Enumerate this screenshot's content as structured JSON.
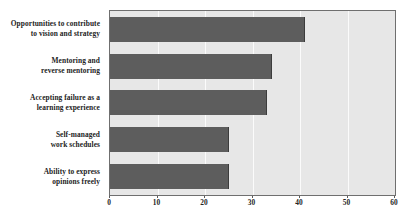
{
  "chart_data": {
    "type": "bar",
    "orientation": "horizontal",
    "title": "",
    "subtitle": "",
    "xlabel": "",
    "ylabel": "",
    "categories": [
      "Opportunities to contribute\nto vision and strategy",
      "Mentoring and\nreverse mentoring",
      "Accepting failure as a\nlearning experience",
      "Self-managed\nwork schedules",
      "Ability to express\nopinions freely"
    ],
    "values": [
      41,
      34,
      33,
      25,
      25
    ],
    "xlim": [
      0,
      60
    ],
    "xticks": [
      0,
      10,
      20,
      30,
      40,
      50,
      60
    ],
    "xtick_labels": [
      "0",
      "10",
      "20",
      "30",
      "40",
      "50",
      "60"
    ],
    "grid": true,
    "grid_axis": "x",
    "legend": false,
    "legend_position": "none",
    "colors": {
      "bar": "#5d5d5d",
      "bar_edge": "#3c3c3c",
      "plot_background": "#e7e7e7",
      "plot_border": "#6f6f6f",
      "gridline": "#fbfbfb",
      "text": "#242424",
      "caption": "#b9b9b9",
      "page_background": "#ffffff"
    }
  },
  "caption": {
    "text": ""
  }
}
